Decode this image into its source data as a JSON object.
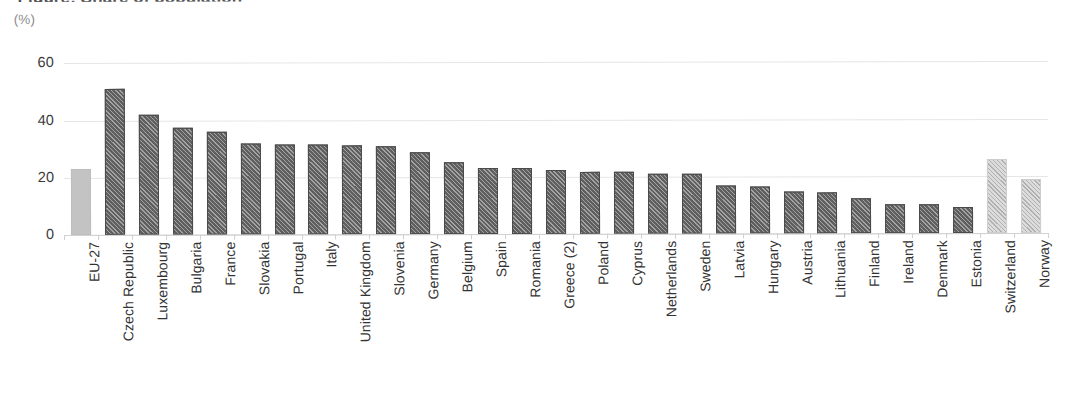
{
  "chart": {
    "title_sliver": "Figure: Share of population",
    "unit_label": "(%)"
  },
  "chart_data": {
    "type": "bar",
    "title": "",
    "xlabel": "",
    "ylabel": "(%)",
    "ylim": [
      0,
      65
    ],
    "yticks": [
      0,
      20,
      40,
      60
    ],
    "ytick_labels": [
      "0",
      "20",
      "40",
      "60"
    ],
    "grid": true,
    "legend": null,
    "orientation": "vertical",
    "categories": [
      "EU-27",
      "Czech Republic",
      "Luxembourg",
      "Bulgaria",
      "France",
      "Slovakia",
      "Portugal",
      "Italy",
      "United Kingdom",
      "Slovenia",
      "Germany",
      "Belgium",
      "Spain",
      "Romania",
      "Greece (2)",
      "Poland",
      "Cyprus",
      "Netherlands",
      "Sweden",
      "Latvia",
      "Hungary",
      "Austria",
      "Lithuania",
      "Finland",
      "Ireland",
      "Denmark",
      "Estonia",
      "Switzerland",
      "Norway"
    ],
    "values": [
      23.0,
      51.0,
      42.0,
      37.3,
      36.0,
      31.7,
      31.6,
      31.3,
      31.2,
      30.6,
      28.6,
      25.0,
      23.0,
      22.9,
      22.2,
      21.8,
      21.7,
      21.0,
      21.0,
      16.8,
      16.6,
      14.7,
      14.3,
      12.2,
      10.1,
      10.0,
      9.0,
      25.8,
      18.8
    ],
    "bar_styles": [
      "lightsolid",
      "dark",
      "dark",
      "dark",
      "dark",
      "dark",
      "dark",
      "dark",
      "dark",
      "dark",
      "dark",
      "dark",
      "dark",
      "dark",
      "dark",
      "dark",
      "dark",
      "dark",
      "dark",
      "dark",
      "dark",
      "dark",
      "dark",
      "dark",
      "dark",
      "dark",
      "dark",
      "lighthatch",
      "lighthatch"
    ],
    "colors": {
      "bar_dark": "#5f5f5f",
      "bar_light_solid": "#c3c3c3",
      "bar_light_hatch": "#dcdcdc",
      "gridline": "#e6e6e6",
      "axis": "#d2d2d2",
      "text": "#333333",
      "unit_text": "#8d8d8d"
    }
  }
}
